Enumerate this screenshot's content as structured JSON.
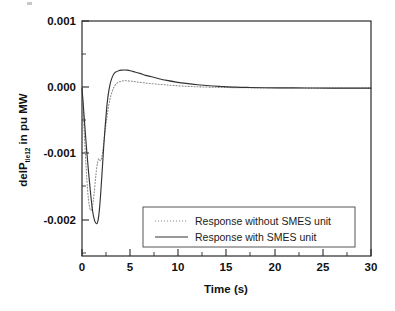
{
  "chart_data": {
    "type": "line",
    "title": "",
    "subtitle": "",
    "xlabel": "Time (s)",
    "ylabel_main": "delP",
    "ylabel_sub": "tie12",
    "ylabel_tail": " in pu MW",
    "ylabel_full": "delP tie12 in pu MW",
    "xlim": [
      0,
      30
    ],
    "ylim": [
      -0.0025,
      0.001
    ],
    "xticks": [
      0,
      5,
      10,
      15,
      20,
      25,
      30
    ],
    "xtick_labels": [
      "0",
      "5",
      "10",
      "15",
      "20",
      "25",
      "30"
    ],
    "yticks": [
      0.001,
      0.0,
      -0.001,
      -0.002
    ],
    "ytick_labels": [
      "0.001",
      "0.000",
      "-0.001",
      "-0.002"
    ],
    "yticks_minor": [
      0.0005,
      -0.0005,
      -0.0015
    ],
    "grid": false,
    "legend_position": "lower-center-right",
    "series": [
      {
        "name": "Response without SMES unit",
        "style": "dotted",
        "color": "#8a8a8a",
        "x": [
          0,
          0.1,
          0.2,
          0.35,
          0.5,
          0.65,
          0.8,
          0.95,
          1.1,
          1.25,
          1.4,
          1.5,
          1.6,
          1.75,
          1.9,
          2.05,
          2.2,
          2.4,
          2.6,
          2.8,
          3.0,
          3.3,
          3.6,
          4.0,
          4.4,
          4.8,
          5.3,
          5.8,
          6.4,
          7.0,
          7.8,
          8.6,
          9.5,
          10.5,
          11.5,
          12.5,
          14.0,
          15.5,
          17.0,
          18.5,
          20.0,
          22.0,
          24.0,
          26.0,
          28.0,
          30.0
        ],
        "y": [
          0.0,
          -0.00022,
          -0.00055,
          -0.00098,
          -0.00135,
          -0.00163,
          -0.00178,
          -0.00182,
          -0.00175,
          -0.00158,
          -0.00136,
          -0.00122,
          -0.00112,
          -0.00105,
          -0.00108,
          -0.00103,
          -0.00088,
          -0.00064,
          -0.00042,
          -0.00024,
          -0.00011,
          1e-05,
          7e-05,
          0.0001,
          0.00011,
          0.000108,
          0.0001,
          9e-05,
          8e-05,
          7e-05,
          6e-05,
          5e-05,
          4e-05,
          3e-05,
          2.3e-05,
          1.8e-05,
          1.2e-05,
          8e-06,
          5e-06,
          3e-06,
          2e-06,
          1e-06,
          5e-07,
          2e-07,
          1e-07,
          0.0
        ]
      },
      {
        "name": "Response with SMES unit",
        "style": "solid",
        "color": "#333333",
        "x": [
          0,
          0.15,
          0.3,
          0.5,
          0.7,
          0.9,
          1.1,
          1.3,
          1.5,
          1.65,
          1.8,
          1.95,
          2.1,
          2.25,
          2.4,
          2.55,
          2.7,
          2.9,
          3.1,
          3.3,
          3.5,
          3.8,
          4.1,
          4.4,
          4.7,
          5.0,
          5.5,
          6.0,
          6.6,
          7.2,
          8.0,
          8.8,
          9.8,
          10.8,
          12.0,
          13.2,
          14.5,
          16.0,
          17.5,
          19.0,
          20.5,
          22.0,
          24.0,
          26.0,
          28.0,
          30.0
        ],
        "y": [
          0.0,
          -0.00028,
          -0.00058,
          -0.00095,
          -0.00128,
          -0.00158,
          -0.00183,
          -0.00197,
          -0.00202,
          -0.00198,
          -0.00182,
          -0.00155,
          -0.00122,
          -0.00088,
          -0.00058,
          -0.00032,
          -0.00012,
          5e-05,
          0.00015,
          0.00021,
          0.00024,
          0.00026,
          0.000268,
          0.00027,
          0.000268,
          0.00026,
          0.00024,
          0.00022,
          0.00019,
          0.00017,
          0.00014,
          0.000115,
          9e-05,
          7e-05,
          5e-05,
          3.5e-05,
          2.5e-05,
          1.5e-05,
          1e-05,
          6e-06,
          4e-06,
          3e-06,
          1.5e-06,
          8e-07,
          3e-07,
          0.0
        ]
      }
    ]
  },
  "legend": {
    "entries": [
      {
        "label": "Response without SMES unit",
        "style": "dotted"
      },
      {
        "label": "Response with SMES unit",
        "style": "solid"
      }
    ]
  },
  "colors": {
    "axis": "#2b2b2b",
    "solid_series": "#333333",
    "dotted_series": "#8a8a8a",
    "background": "#ffffff",
    "legend_border": "#555555"
  }
}
